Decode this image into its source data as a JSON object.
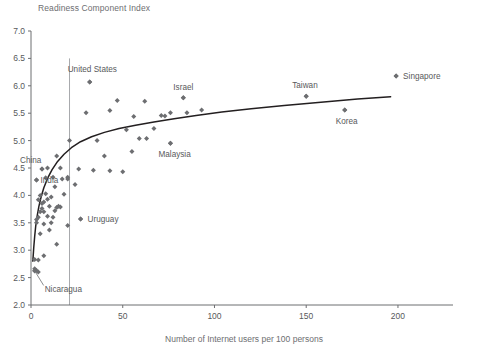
{
  "chart_data": {
    "type": "scatter",
    "title": "Readiness Component Index",
    "xlabel": "Number of Internet users per 100 persons",
    "ylabel": "Readiness Component Index",
    "xlim": [
      0,
      230
    ],
    "ylim": [
      2.0,
      7.0
    ],
    "grid": false,
    "legend": "none",
    "xticks": [
      0,
      50,
      100,
      150,
      200
    ],
    "xtick_labels": [
      "0",
      "50",
      "100",
      "150",
      "200"
    ],
    "yticks": [
      2.0,
      2.5,
      3.0,
      3.5,
      4.0,
      4.5,
      5.0,
      5.5,
      6.0,
      6.5,
      7.0
    ],
    "ytick_labels": [
      "2.0",
      "2.5",
      "3.0",
      "3.5",
      "4.0",
      "4.5",
      "5.0",
      "5.5",
      "6.0",
      "6.5",
      "7.0"
    ],
    "marker": "diamond",
    "marker_color": "#6d6e71",
    "trend_line": {
      "description": "logarithmic fit curve",
      "color": "#231f20",
      "points": [
        [
          1.0,
          2.8
        ],
        [
          1.5,
          3.05
        ],
        [
          2.0,
          3.25
        ],
        [
          2.6,
          3.45
        ],
        [
          3.4,
          3.63
        ],
        [
          4.3,
          3.8
        ],
        [
          5.5,
          3.97
        ],
        [
          7.0,
          4.14
        ],
        [
          9.0,
          4.31
        ],
        [
          11.5,
          4.47
        ],
        [
          14.5,
          4.62
        ],
        [
          18.0,
          4.75
        ],
        [
          22.0,
          4.87
        ],
        [
          27.0,
          4.98
        ],
        [
          33.0,
          5.07
        ],
        [
          40.0,
          5.15
        ],
        [
          48.0,
          5.22
        ],
        [
          57.0,
          5.28
        ],
        [
          67.0,
          5.34
        ],
        [
          78.0,
          5.4
        ],
        [
          90.0,
          5.46
        ],
        [
          104.0,
          5.52
        ],
        [
          120.0,
          5.58
        ],
        [
          138.0,
          5.64
        ],
        [
          158.0,
          5.7
        ],
        [
          178.0,
          5.76
        ],
        [
          196.0,
          5.8
        ]
      ]
    },
    "reference_lines": [
      {
        "type": "vertical",
        "x": 21,
        "color": "#a7a9ac",
        "y_from": 2.0,
        "y_to": 6.5
      }
    ],
    "labeled_points": [
      {
        "label": "United States",
        "x": 32,
        "y": 6.07,
        "label_dx": -22,
        "label_dy": -10
      },
      {
        "label": "Singapore",
        "x": 199,
        "y": 6.18,
        "label_dx": 7,
        "label_dy": 3
      },
      {
        "label": "Israel",
        "x": 83,
        "y": 5.78,
        "label_dx": -10,
        "label_dy": -8
      },
      {
        "label": "Taiwan",
        "x": 150,
        "y": 5.81,
        "label_dx": -14,
        "label_dy": -8
      },
      {
        "label": "Korea",
        "x": 171,
        "y": 5.56,
        "label_dx": -9,
        "label_dy": 14
      },
      {
        "label": "Malaysia",
        "x": 76,
        "y": 4.95,
        "label_dx": -12,
        "label_dy": 14
      },
      {
        "label": "China",
        "x": 6,
        "y": 4.48,
        "label_dx": -22,
        "label_dy": -6
      },
      {
        "label": "India",
        "x": 3,
        "y": 4.28,
        "label_dx": 4,
        "label_dy": 3
      },
      {
        "label": "Uruguay",
        "x": 27,
        "y": 3.57,
        "label_dx": 7,
        "label_dy": 3
      },
      {
        "label": "Nicaragua",
        "x": 2,
        "y": 2.63,
        "label_dx": 10,
        "label_dy": 22,
        "leader": true
      }
    ],
    "points": [
      [
        199,
        6.18
      ],
      [
        32,
        6.07
      ],
      [
        150,
        5.81
      ],
      [
        83,
        5.78
      ],
      [
        171,
        5.56
      ],
      [
        93,
        5.56
      ],
      [
        85,
        5.51
      ],
      [
        76,
        5.51
      ],
      [
        71,
        5.46
      ],
      [
        73,
        5.45
      ],
      [
        62,
        5.72
      ],
      [
        47,
        5.73
      ],
      [
        43,
        5.55
      ],
      [
        30,
        5.51
      ],
      [
        56,
        5.44
      ],
      [
        52,
        5.2
      ],
      [
        67,
        5.22
      ],
      [
        59,
        5.04
      ],
      [
        63,
        5.04
      ],
      [
        55,
        4.8
      ],
      [
        76,
        4.95
      ],
      [
        40,
        4.72
      ],
      [
        21,
        5.0
      ],
      [
        14,
        4.72
      ],
      [
        9,
        4.5
      ],
      [
        6,
        4.48
      ],
      [
        3,
        4.28
      ],
      [
        20,
        4.33
      ],
      [
        20,
        4.3
      ],
      [
        17,
        4.3
      ],
      [
        26,
        4.48
      ],
      [
        34,
        4.46
      ],
      [
        43,
        4.45
      ],
      [
        12,
        4.33
      ],
      [
        13,
        4.16
      ],
      [
        8,
        4.32
      ],
      [
        8,
        4.03
      ],
      [
        5,
        4.0
      ],
      [
        4,
        3.92
      ],
      [
        7,
        3.88
      ],
      [
        10,
        3.8
      ],
      [
        14,
        3.78
      ],
      [
        15,
        3.8
      ],
      [
        16,
        3.79
      ],
      [
        13,
        3.72
      ],
      [
        6,
        3.76
      ],
      [
        5,
        3.7
      ],
      [
        4,
        3.6
      ],
      [
        3,
        3.56
      ],
      [
        3,
        3.5
      ],
      [
        7,
        3.7
      ],
      [
        11,
        3.5
      ],
      [
        7,
        3.48
      ],
      [
        5,
        3.3
      ],
      [
        10,
        3.37
      ],
      [
        20,
        3.45
      ],
      [
        27,
        3.57
      ],
      [
        14,
        3.11
      ],
      [
        7,
        2.9
      ],
      [
        4,
        2.82
      ],
      [
        2,
        2.83
      ],
      [
        3,
        2.63
      ],
      [
        2,
        2.62
      ],
      [
        4,
        2.6
      ],
      [
        2,
        2.66
      ],
      [
        24,
        4.2
      ],
      [
        18,
        4.02
      ],
      [
        11,
        3.97
      ],
      [
        9,
        3.93
      ],
      [
        6,
        3.85
      ],
      [
        12,
        3.6
      ],
      [
        9,
        3.62
      ],
      [
        16,
        4.5
      ],
      [
        36,
        5.0
      ],
      [
        50,
        4.43
      ]
    ]
  }
}
